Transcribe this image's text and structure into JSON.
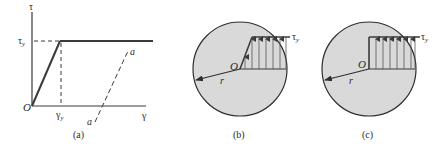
{
  "figure": {
    "colors": {
      "line": "#3a3a3a",
      "thin_line": "#555555",
      "circle_fill": "#d9d9d9",
      "circle_stroke": "#2e2e2e",
      "text": "#2a2a2a"
    },
    "panel_a": {
      "caption": "(a)",
      "y_axis_label": "τ",
      "x_axis_label": "γ",
      "origin_label": "O",
      "yield_stress_label": "τ",
      "yield_stress_subscript": "y",
      "yield_strain_label": "γ",
      "yield_strain_subscript": "y",
      "unload_line_label_top": "a",
      "unload_line_label_bottom": "a",
      "description": "Elastic–perfectly plastic shear stress–strain curve with unloading line a–a"
    },
    "panel_b": {
      "caption": "(b)",
      "origin_label": "O",
      "radius_label": "r",
      "stress_label": "τ",
      "stress_subscript": "y",
      "description": "Partially plastic shaft cross-section: elastic core with linear stress then constant τy"
    },
    "panel_c": {
      "caption": "(c)",
      "origin_label": "O",
      "radius_label": "r",
      "stress_label": "τ",
      "stress_subscript": "y",
      "description": "Fully plastic shaft cross-section: uniform stress τy across radius"
    }
  }
}
